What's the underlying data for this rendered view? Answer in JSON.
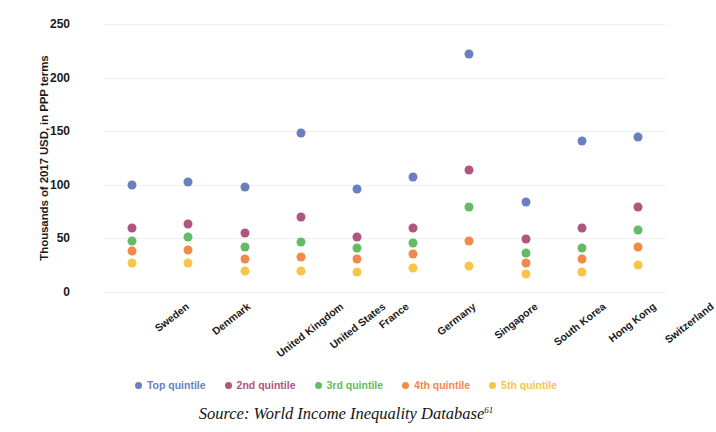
{
  "chart": {
    "ylabel": "Thousands of 2017 USD, in PPP terms",
    "caption_text": "Source: World Income Inequality Database",
    "caption_footnote": "61"
  },
  "chart_data": {
    "type": "scatter",
    "title": "",
    "xlabel": "",
    "ylabel": "Thousands of 2017 USD, in PPP terms",
    "ylim": [
      0,
      250
    ],
    "yticks": [
      0,
      50,
      100,
      150,
      200,
      250
    ],
    "grid": true,
    "legend_position": "bottom",
    "categories": [
      "Sweden",
      "Denmark",
      "United Kingdom",
      "United States",
      "France",
      "Germany",
      "Singapore",
      "South Korea",
      "Hong Kong",
      "Switzerland"
    ],
    "series": [
      {
        "name": "Top quintile",
        "color": "#6b7fc0",
        "values": [
          100,
          103,
          98,
          148,
          96,
          107,
          222,
          84,
          141,
          145
        ]
      },
      {
        "name": "2nd quintile",
        "color": "#b0557f",
        "values": [
          60,
          63,
          55,
          70,
          51,
          60,
          114,
          49,
          60,
          79
        ]
      },
      {
        "name": "3rd quintile",
        "color": "#63bc64",
        "values": [
          48,
          51,
          42,
          47,
          41,
          46,
          79,
          36,
          41,
          58
        ]
      },
      {
        "name": "4th quintile",
        "color": "#f08a4b",
        "values": [
          38,
          39,
          31,
          33,
          31,
          35,
          48,
          27,
          31,
          42
        ]
      },
      {
        "name": "5th quintile",
        "color": "#f7c548",
        "values": [
          27,
          27,
          20,
          20,
          19,
          22,
          24,
          17,
          19,
          25
        ]
      }
    ]
  }
}
